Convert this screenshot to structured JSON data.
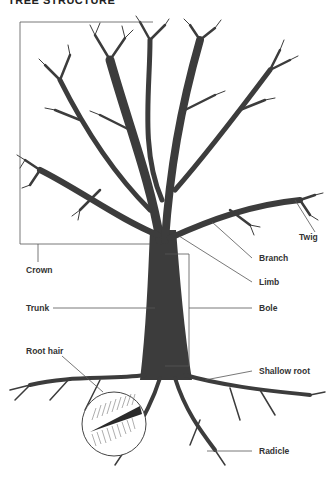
{
  "title": "TREE STRUCTURE",
  "labels": {
    "twig": "Twig",
    "branch": "Branch",
    "crown": "Crown",
    "limb": "Limb",
    "trunk": "Trunk",
    "bole": "Bole",
    "root_hair": "Root hair",
    "shallow_root": "Shallow root",
    "radicle": "Radicle"
  },
  "colors": {
    "tree": "#3c3c3c",
    "lines": "#555555",
    "text": "#333333"
  }
}
